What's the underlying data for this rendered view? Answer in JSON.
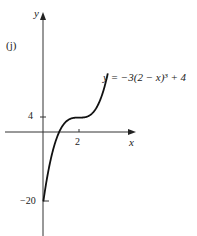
{
  "panel": {
    "label": "(j)"
  },
  "axes": {
    "x_label": "x",
    "y_label": "y"
  },
  "ticks": {
    "y_4": "4",
    "x_2": "2",
    "y_neg20": "−20"
  },
  "equation": {
    "text": "y = −3(2 − x)³ + 4"
  },
  "chart_data": {
    "type": "line",
    "title": "",
    "panel_label": "(j)",
    "xlabel": "x",
    "ylabel": "y",
    "function": "y = -3(2 - x)^3 + 4",
    "annotation": "y = −3(2 − x)³ + 4",
    "x_ticks": [
      2
    ],
    "y_ticks": [
      4,
      -20
    ],
    "inflection_point": {
      "x": 2,
      "y": 4
    },
    "y_intercept": -20,
    "x_intercept": 1.1,
    "x": [
      0,
      0.5,
      1.0,
      1.1,
      1.5,
      2.0,
      2.5,
      3.0,
      3.5
    ],
    "values": [
      -20,
      -6.1,
      1,
      1.8,
      3.6,
      4,
      4.4,
      7,
      14.1
    ],
    "grid": false,
    "legend": "none"
  },
  "colors": {
    "curve": "#111111",
    "axis": "#333333",
    "text": "#222222"
  }
}
